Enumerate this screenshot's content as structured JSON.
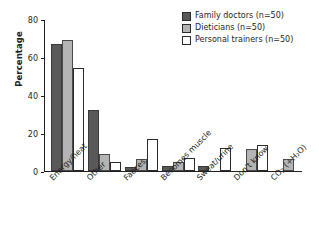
{
  "chart_data": {
    "type": "bar",
    "title": "",
    "xlabel": "",
    "ylabel": "Percentage",
    "ylim": [
      0,
      80
    ],
    "yticks": [
      0,
      20,
      40,
      60,
      80
    ],
    "grid": false,
    "legend_position": "top-right",
    "categories": [
      "Energy/heat",
      "Other",
      "Faeces",
      "Becomes muscle",
      "Sweat/urine",
      "Don't know",
      "CO2 (+H2O)"
    ],
    "series": [
      {
        "name": "Family doctors (n=50)",
        "values": [
          67,
          32,
          2,
          2.5,
          2.5,
          0,
          0
        ]
      },
      {
        "name": "Dieticians (n=50)",
        "values": [
          69,
          9,
          6.5,
          5,
          0,
          11.5,
          6.5
        ]
      },
      {
        "name": "Personal trainers (n=50)",
        "values": [
          54,
          4.5,
          17,
          7,
          12,
          13.5,
          0
        ]
      }
    ]
  },
  "axis": {
    "ylabel": "Percentage",
    "tick_labels": [
      "0",
      "20",
      "40",
      "60",
      "80"
    ]
  },
  "categories_display": [
    {
      "main": "Energy/heat",
      "sub": "",
      "tail": ""
    },
    {
      "main": "Other",
      "sub": "",
      "tail": ""
    },
    {
      "main": "Faeces",
      "sub": "",
      "tail": ""
    },
    {
      "main": "Becomes muscle",
      "sub": "",
      "tail": ""
    },
    {
      "main": "Sweat/urine",
      "sub": "",
      "tail": ""
    },
    {
      "main": "Don't know",
      "sub": "",
      "tail": ""
    },
    {
      "main": "CO",
      "sub": "2",
      "tail": " (+H2O)"
    }
  ],
  "legend": {
    "items": [
      {
        "label": "Family doctors (n=50)",
        "color": "#595959",
        "swatch": "filled-dark"
      },
      {
        "label": "Dieticians (n=50)",
        "color": "#b4b4b4",
        "swatch": "filled-gray"
      },
      {
        "label": "Personal trainers (n=50)",
        "color": "#ffffff",
        "swatch": "outline-white"
      }
    ]
  },
  "colors": {
    "series_dark": "#595959",
    "series_gray": "#b4b4b4",
    "series_white": "#ffffff",
    "axis": "#231f20",
    "background": "#ffffff"
  }
}
